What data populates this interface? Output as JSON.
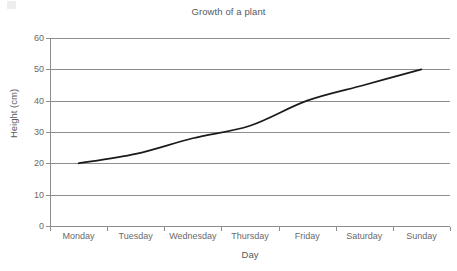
{
  "chart_data": {
    "type": "line",
    "title": "Growth of a plant",
    "xlabel": "Day",
    "ylabel": "Height (cm)",
    "categories": [
      "Monday",
      "Tuesday",
      "Wednesday",
      "Thursday",
      "Friday",
      "Saturday",
      "Sunday"
    ],
    "values": [
      20,
      23,
      28,
      32,
      40,
      45,
      50
    ],
    "series": [
      {
        "name": "Height",
        "values": [
          20,
          23,
          28,
          32,
          40,
          45,
          50
        ]
      }
    ],
    "ylim": [
      0,
      60
    ],
    "yticks": [
      0,
      10,
      20,
      30,
      40,
      50,
      60
    ],
    "ytick_labels": [
      "0",
      "10",
      "20",
      "30",
      "40",
      "50",
      "60"
    ],
    "grid": true,
    "grid_axis": "y",
    "legend": "none",
    "line_color": "#1a1a1a",
    "grid_color": "#8d8d90",
    "text_color": "#59595c",
    "background": "#ffffff"
  },
  "axes": {
    "y_title": "Height (cm)",
    "x_title": "Day"
  }
}
